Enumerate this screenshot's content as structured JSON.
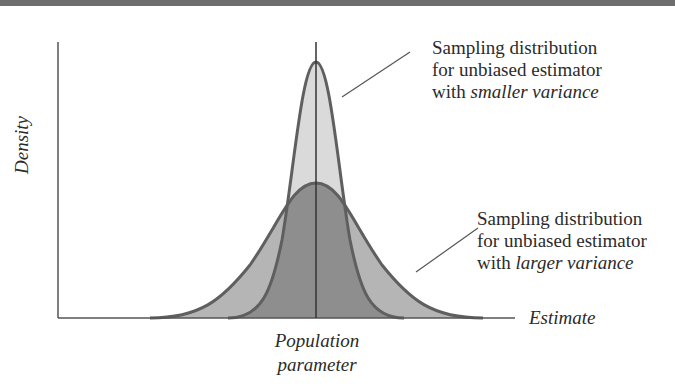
{
  "figure": {
    "type": "sampling-distribution-comparison",
    "y_axis_label": "Density",
    "x_axis_label": "Estimate",
    "center_label_line1": "Population",
    "center_label_line2": "parameter",
    "annotations": {
      "small_variance": {
        "line1": "Sampling distribution",
        "line2": "for unbiased estimator",
        "line3_prefix": "with ",
        "line3_emphasis": "smaller variance"
      },
      "large_variance": {
        "line1": "Sampling distribution",
        "line2": "for unbiased estimator",
        "line3_prefix": "with ",
        "line3_emphasis": "larger variance"
      }
    },
    "curves": [
      {
        "name": "smaller variance",
        "shape": "normal",
        "center": "population parameter",
        "relative_sd": 0.5,
        "fill": "#d9d9d9"
      },
      {
        "name": "larger variance",
        "shape": "normal",
        "center": "population parameter",
        "relative_sd": 1.0,
        "fill": "#b3b3b3"
      }
    ],
    "colors": {
      "top_bar": "#6e6e6e",
      "curve_stroke": "#5f5f5f",
      "narrow_fill": "#d9d9d9",
      "wide_fill": "#b3b3b3",
      "overlap_fill": "#8c8c8c",
      "axis": "#555555"
    }
  }
}
